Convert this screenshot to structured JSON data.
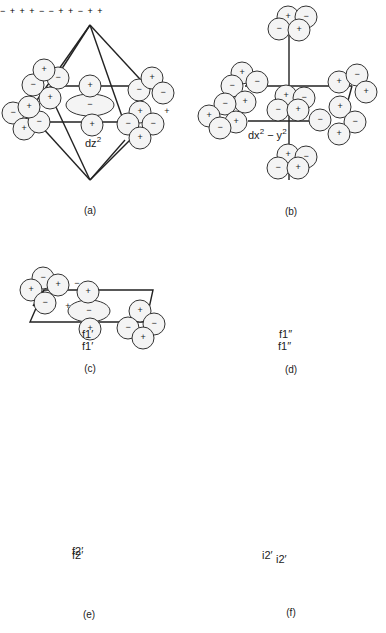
{
  "figure": {
    "panels": [
      {
        "id": "a",
        "caption": "(a)",
        "orbital_label": "dz",
        "orbital_sup": "2"
      },
      {
        "id": "b",
        "caption": "(b)",
        "orbital_label": "dx",
        "orbital_sup": "2",
        "orbital_label2": " − y",
        "orbital_sup2": "2"
      },
      {
        "id": "c",
        "caption": "(c)",
        "orbital_label": "f1′"
      },
      {
        "id": "d",
        "caption": "(d)",
        "orbital_label": "f1″"
      },
      {
        "id": "e",
        "caption": "(e)",
        "orbital_label": "f2′"
      },
      {
        "id": "f",
        "caption": "(f)",
        "orbital_label": "i2′"
      }
    ],
    "signs": {
      "plus": "+",
      "minus": "−"
    },
    "colors": {
      "line": "#222222",
      "lobe_fill": "#f4f4f4",
      "background": "#ffffff"
    }
  }
}
